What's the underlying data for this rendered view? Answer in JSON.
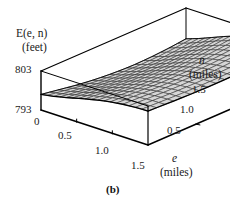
{
  "figure": {
    "caption": "(b)",
    "zaxis": {
      "title_line1": "E(e, n)",
      "title_line2": "(feet)",
      "ticks": [
        "803",
        "793"
      ],
      "max": 803,
      "min": 793,
      "unit": "feet",
      "variable": "E(e, n)"
    },
    "xaxis": {
      "title_line1": "e",
      "title_line2": "(miles)",
      "ticks": [
        "0",
        "0.5",
        "1.0",
        "1.5"
      ],
      "unit": "miles",
      "variable": "e"
    },
    "yaxis": {
      "title_line1": "n",
      "title_line2": "(miles)",
      "ticks": [
        "1.5",
        "1.0",
        "0.5"
      ],
      "unit": "miles",
      "variable": "n"
    },
    "colors": {
      "surface_fill": "#d6d6d6",
      "mesh_line": "#2b2b2b",
      "box_line": "#000000",
      "background": "#ffffff"
    }
  },
  "chart_data": {
    "type": "surface",
    "title": "",
    "xlabel": "e (miles)",
    "ylabel": "n (miles)",
    "zlabel": "E(e, n) (feet)",
    "xlim": [
      0,
      1.5
    ],
    "ylim": [
      0,
      1.5
    ],
    "zlim": [
      793,
      803
    ],
    "xticks": [
      0,
      0.5,
      1.0,
      1.5
    ],
    "yticks": [
      0.5,
      1.0,
      1.5
    ],
    "zticks": [
      793,
      803
    ],
    "grid": true,
    "legend": false,
    "x": [
      0,
      0.1875,
      0.375,
      0.5625,
      0.75,
      0.9375,
      1.125,
      1.3125,
      1.5
    ],
    "y": [
      0,
      0.1875,
      0.375,
      0.5625,
      0.75,
      0.9375,
      1.125,
      1.3125,
      1.5
    ],
    "z": [
      [
        797.0,
        797.6,
        798.4,
        799.3,
        800.1,
        800.8,
        801.3,
        801.6,
        801.7
      ],
      [
        796.2,
        796.9,
        797.8,
        798.8,
        799.7,
        800.5,
        801.1,
        801.4,
        801.5
      ],
      [
        795.4,
        796.2,
        797.2,
        798.3,
        799.3,
        800.2,
        800.8,
        801.2,
        801.3
      ],
      [
        794.8,
        795.7,
        796.8,
        798.0,
        799.1,
        800.0,
        800.7,
        801.1,
        801.2
      ],
      [
        794.4,
        795.4,
        796.6,
        797.9,
        799.0,
        800.0,
        800.7,
        801.1,
        801.2
      ],
      [
        794.2,
        795.3,
        796.6,
        797.9,
        799.1,
        800.1,
        800.8,
        801.2,
        801.3
      ],
      [
        794.3,
        795.4,
        796.8,
        798.2,
        799.4,
        800.4,
        801.1,
        801.5,
        801.6
      ],
      [
        794.6,
        795.8,
        797.2,
        798.6,
        799.8,
        800.8,
        801.5,
        801.9,
        802.0
      ],
      [
        795.1,
        796.3,
        797.7,
        799.1,
        800.3,
        801.2,
        801.9,
        802.3,
        802.4
      ]
    ]
  }
}
